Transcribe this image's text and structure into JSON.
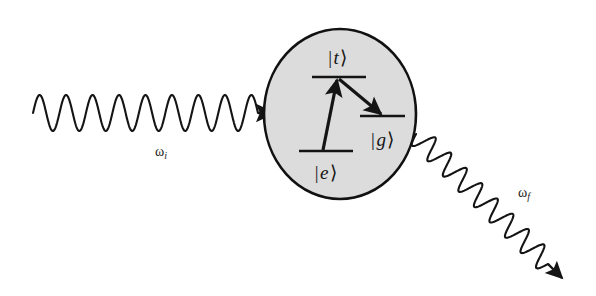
{
  "figure": {
    "background_color": "#ffffff",
    "ink_color": "#141414",
    "ellipse_fill_color": "#dcdcdc",
    "ellipse_stroke_color": "#111111"
  },
  "incoming_photon": {
    "label": "ω",
    "subscript": "i",
    "wave": {
      "x_start": 33,
      "x_end": 258,
      "y_center": 113,
      "amplitude": 18,
      "cycles": 8.5,
      "direction": "left-to-right",
      "arrowhead_tip_x": 274,
      "arrowhead_tip_y": 113
    },
    "label_x": 161,
    "label_y": 152
  },
  "outgoing_photon": {
    "label": "ω",
    "subscript": "f",
    "wave": {
      "x_start": 416,
      "y_start": 134,
      "x_end": 548,
      "y_end": 264,
      "amplitude": 11,
      "cycles": 8.5,
      "direction": "upper-left-to-lower-right",
      "arrowhead_tip_x": 562,
      "arrowhead_tip_y": 278
    },
    "label_x": 524,
    "label_y": 193
  },
  "scatterer": {
    "name": "atom-ellipse",
    "center_x": 340,
    "center_y": 114,
    "radius_x": 76,
    "radius_y": 85,
    "stroke_width": 2.6
  },
  "energy_levels": [
    {
      "id": "t",
      "ket": "|t⟩",
      "symbol": "t",
      "line_x1": 312,
      "line_x2": 366,
      "line_y": 77,
      "label_x": 338,
      "label_y": 57,
      "label_position": "above"
    },
    {
      "id": "g",
      "ket": "|g⟩",
      "symbol": "g",
      "line_x1": 360,
      "line_x2": 405,
      "line_y": 116,
      "label_x": 383,
      "label_y": 139,
      "label_position": "below"
    },
    {
      "id": "e",
      "ket": "|e⟩",
      "symbol": "e",
      "line_x1": 299,
      "line_x2": 353,
      "line_y": 151,
      "label_x": 326,
      "label_y": 172,
      "label_position": "below"
    }
  ],
  "transitions": [
    {
      "id": "absorption",
      "from_level": "e",
      "to_level": "t",
      "x1": 323,
      "y1": 150,
      "x2": 337,
      "y2": 80,
      "stroke_width": 3.2
    },
    {
      "id": "emission",
      "from_level": "t",
      "to_level": "g",
      "x1": 339,
      "y1": 79,
      "x2": 381,
      "y2": 114,
      "stroke_width": 3.2
    }
  ]
}
